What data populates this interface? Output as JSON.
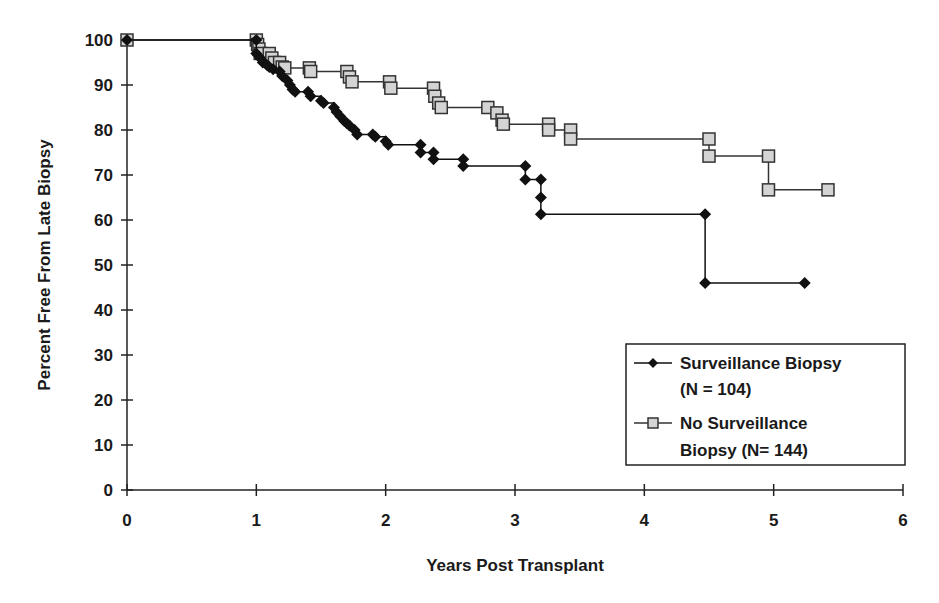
{
  "chart_data": {
    "type": "line",
    "subtype": "kaplan-meier step",
    "title": "",
    "xlabel": "Years Post Transplant",
    "ylabel": "Percent Free From Late Biopsy",
    "xlim": [
      0,
      6
    ],
    "ylim": [
      0,
      100
    ],
    "xticks": [
      0,
      1,
      2,
      3,
      4,
      5,
      6
    ],
    "yticks": [
      0,
      10,
      20,
      30,
      40,
      50,
      60,
      70,
      80,
      90,
      100
    ],
    "grid": false,
    "legend_position": "lower right, boxed",
    "series": [
      {
        "name": "Surveillance Biopsy (N = 104)",
        "legend_lines": [
          "Surveillance Biopsy",
          "(N = 104)"
        ],
        "marker": "diamond",
        "color": "#111111",
        "marker_fill": "#111111",
        "points": [
          [
            0,
            100
          ],
          [
            1.0,
            100
          ],
          [
            1.0,
            97
          ],
          [
            1.03,
            96
          ],
          [
            1.05,
            95
          ],
          [
            1.08,
            94.5
          ],
          [
            1.1,
            94
          ],
          [
            1.13,
            93.5
          ],
          [
            1.18,
            93
          ],
          [
            1.2,
            92
          ],
          [
            1.24,
            91
          ],
          [
            1.26,
            90
          ],
          [
            1.28,
            89
          ],
          [
            1.3,
            88.5
          ],
          [
            1.4,
            88.5
          ],
          [
            1.42,
            87.5
          ],
          [
            1.5,
            86.5
          ],
          [
            1.52,
            86
          ],
          [
            1.6,
            85
          ],
          [
            1.62,
            84
          ],
          [
            1.65,
            83
          ],
          [
            1.68,
            82
          ],
          [
            1.7,
            81.5
          ],
          [
            1.72,
            81
          ],
          [
            1.76,
            80
          ],
          [
            1.78,
            79
          ],
          [
            1.9,
            79
          ],
          [
            1.92,
            78.5
          ],
          [
            2.0,
            77.5
          ],
          [
            2.02,
            76.7
          ],
          [
            2.27,
            76.7
          ],
          [
            2.27,
            75
          ],
          [
            2.37,
            75
          ],
          [
            2.37,
            73.5
          ],
          [
            2.6,
            73.5
          ],
          [
            2.6,
            72
          ],
          [
            3.08,
            72
          ],
          [
            3.08,
            69
          ],
          [
            3.2,
            69
          ],
          [
            3.2,
            65
          ],
          [
            3.2,
            61.3
          ],
          [
            4.47,
            61.3
          ],
          [
            4.47,
            46
          ],
          [
            5.24,
            46
          ]
        ]
      },
      {
        "name": "No Surveillance Biopsy (N= 144)",
        "legend_lines": [
          "No Surveillance",
          "Biopsy (N= 144)"
        ],
        "marker": "square",
        "color": "#333333",
        "marker_fill": "#d4d4d4",
        "points": [
          [
            0,
            100
          ],
          [
            1.0,
            100
          ],
          [
            1.01,
            99
          ],
          [
            1.02,
            98
          ],
          [
            1.03,
            97
          ],
          [
            1.1,
            97
          ],
          [
            1.12,
            96
          ],
          [
            1.14,
            95
          ],
          [
            1.18,
            95
          ],
          [
            1.2,
            94
          ],
          [
            1.22,
            93.8
          ],
          [
            1.41,
            93.8
          ],
          [
            1.42,
            93
          ],
          [
            1.7,
            93
          ],
          [
            1.72,
            91.8
          ],
          [
            1.74,
            90.7
          ],
          [
            2.03,
            90.7
          ],
          [
            2.04,
            89.3
          ],
          [
            2.37,
            89.3
          ],
          [
            2.38,
            87.5
          ],
          [
            2.41,
            86
          ],
          [
            2.43,
            85
          ],
          [
            2.79,
            85
          ],
          [
            2.86,
            83.8
          ],
          [
            2.9,
            82.2
          ],
          [
            2.91,
            81.3
          ],
          [
            3.26,
            81.3
          ],
          [
            3.26,
            80
          ],
          [
            3.43,
            80
          ],
          [
            3.43,
            78
          ],
          [
            4.5,
            78
          ],
          [
            4.5,
            74.2
          ],
          [
            4.96,
            74.2
          ],
          [
            4.96,
            66.7
          ],
          [
            5.42,
            66.7
          ]
        ]
      }
    ]
  },
  "axes": {
    "x_title": "Years Post Transplant",
    "y_title": "Percent Free From Late Biopsy"
  },
  "legend": {
    "items": [
      {
        "line1": "Surveillance Biopsy",
        "line2": "(N = 104)"
      },
      {
        "line1": "No Surveillance",
        "line2": "Biopsy (N= 144)"
      }
    ]
  }
}
